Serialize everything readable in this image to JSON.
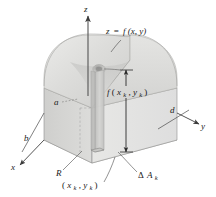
{
  "figure": {
    "name": "volume-under-surface-diagram"
  },
  "axes": {
    "z_label": "z",
    "y_label": "y",
    "x_label": "x"
  },
  "labels": {
    "surface_equation": "z = f(x, y)",
    "surface_equation_parts": {
      "lhs": "z",
      "eq": "=",
      "fn": "f",
      "args": "(x, y)"
    },
    "column_height": "f(xₖ, yₖ)",
    "column_height_parts": {
      "fn": "f",
      "open": "(",
      "x": "x",
      "x_sub": "k",
      "comma": ", ",
      "y": "y",
      "y_sub": "k",
      "close": ")"
    },
    "base_area": "ΔAₖ",
    "base_area_parts": {
      "delta": "Δ",
      "a": "A",
      "sub": "k"
    },
    "region": "R",
    "sample_point": "(xₖ, yₖ)",
    "sample_point_parts": {
      "open": "(",
      "x": "x",
      "x_sub": "k",
      "comma": ", ",
      "y": "y",
      "y_sub": "k",
      "close": ")"
    },
    "depth_a": "a",
    "depth_b": "b",
    "depth_d": "d"
  },
  "colors": {
    "background": "#ffffff",
    "ink": "#1a1a1a",
    "line": "#555555",
    "thin_line": "#8a8a8a",
    "dome_fill": "#d8d8d6",
    "dome_fill_light": "#e6e6e4",
    "box_front": "#e2e2e0",
    "box_side": "#d0d0ce",
    "base_fill": "#ebebe9",
    "column_fill": "#c9c9c7",
    "shadow": "#bdbdbb"
  }
}
